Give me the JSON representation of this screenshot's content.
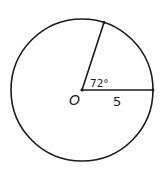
{
  "figure": {
    "type": "circle-sector-diagram",
    "center_label": "O",
    "angle_label": "72°",
    "radius_label": "5",
    "angle_degrees": 72,
    "radius_value": 5,
    "colors": {
      "stroke": "#1a1a1a",
      "background": "#ffffff"
    }
  }
}
